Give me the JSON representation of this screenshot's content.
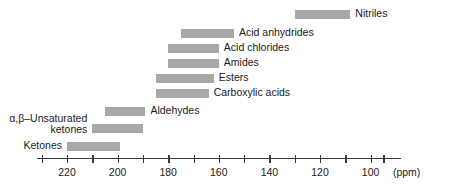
{
  "chart_data": {
    "type": "bar",
    "orientation": "horizontal-ranges",
    "title": "",
    "subtitle": "",
    "xlabel": "(ppm)",
    "ylabel": "",
    "xlim": [
      232,
      88
    ],
    "x_axis_reversed": true,
    "grid": false,
    "legend": null,
    "tick_interval": 10,
    "labeled_tick_interval": 20,
    "tick_values": [
      230,
      220,
      210,
      200,
      190,
      180,
      170,
      160,
      150,
      140,
      130,
      120,
      110,
      100,
      95
    ],
    "tick_labels": [
      {
        "value": 220,
        "text": "220"
      },
      {
        "value": 200,
        "text": "200"
      },
      {
        "value": 180,
        "text": "180"
      },
      {
        "value": 160,
        "text": "160"
      },
      {
        "value": 140,
        "text": "140"
      },
      {
        "value": 120,
        "text": "120"
      },
      {
        "value": 100,
        "text": "100"
      }
    ],
    "unit_annotation": "(ppm)",
    "ranges": [
      {
        "name": "Nitriles",
        "start": 130,
        "end": 108,
        "label_side": "right"
      },
      {
        "name": "Acid anhydrides",
        "start": 175,
        "end": 154,
        "label_side": "right"
      },
      {
        "name": "Acid chlorides",
        "start": 180,
        "end": 160,
        "label_side": "right"
      },
      {
        "name": "Amides",
        "start": 180,
        "end": 160,
        "label_side": "right"
      },
      {
        "name": "Esters",
        "start": 185,
        "end": 162,
        "label_side": "right"
      },
      {
        "name": "Carboxylic acids",
        "start": 185,
        "end": 164,
        "label_side": "right"
      },
      {
        "name": "Aldehydes",
        "start": 205,
        "end": 189,
        "label_side": "right"
      },
      {
        "name": "α,β–Unsaturated ketones",
        "start": 210,
        "end": 190,
        "label_side": "left",
        "line1": "α,β–Unsaturated",
        "line2": "ketones"
      },
      {
        "name": "Ketones",
        "start": 220,
        "end": 199,
        "label_side": "left"
      }
    ],
    "colors": {
      "bar": "#a8a8a8",
      "axis": "#3b3b3b",
      "text": "#1a1a1a",
      "background": "#ffffff"
    }
  }
}
